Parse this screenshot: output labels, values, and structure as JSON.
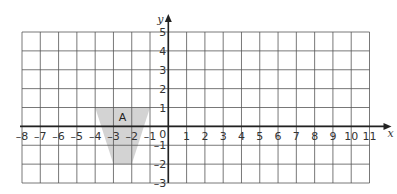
{
  "diagram": {
    "type": "coordinate-grid",
    "x_axis": {
      "label": "x",
      "min": -8,
      "max": 11,
      "ticks": [
        "-8",
        "-7",
        "-6",
        "-5",
        "-4",
        "-3",
        "-2",
        "-1",
        "1",
        "2",
        "3",
        "4",
        "5",
        "6",
        "7",
        "8",
        "9",
        "10",
        "11"
      ]
    },
    "y_axis": {
      "label": "y",
      "min": -3,
      "max": 5,
      "ticks": [
        "5",
        "4",
        "3",
        "2",
        "1",
        "-1",
        "-2",
        "-3"
      ]
    },
    "origin_label": "0",
    "shape": {
      "label": "A",
      "fill": "#d3d3d3",
      "vertices": [
        [
          -4,
          1
        ],
        [
          -1,
          1
        ],
        [
          -2,
          -2
        ],
        [
          -3,
          -2
        ]
      ]
    },
    "colors": {
      "grid": "#555555",
      "axis": "#222222"
    }
  }
}
